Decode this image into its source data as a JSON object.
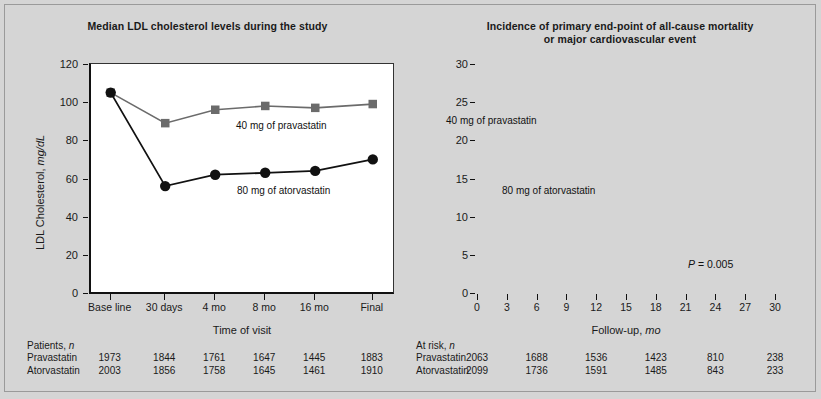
{
  "figure": {
    "background": "#d5d5d5",
    "panel_background": "#ffffff"
  },
  "colors": {
    "pravastatin": "#6b6b6b",
    "atorvastatin": "#111111",
    "axis": "#111111",
    "text": "#1a1a1a"
  },
  "left_panel": {
    "title": "Median LDL cholesterol levels during the study",
    "ylabel_main": "LDL Cholesterol, ",
    "ylabel_unit": "mg/dL",
    "xlabel": "Time of visit",
    "yticks": [
      "0",
      "20",
      "40",
      "60",
      "80",
      "100",
      "120"
    ],
    "xticks": [
      "Base line",
      "30 days",
      "4 mo",
      "8 mo",
      "16 mo",
      "Final"
    ],
    "series_label_pravastatin": "40 mg of pravastatin",
    "series_label_atorvastatin": "80 mg of atorvastatin",
    "risk_table": {
      "header_text": "Patients, ",
      "header_italic": "n",
      "rows": [
        {
          "label": "Pravastatin",
          "values": [
            "1973",
            "1844",
            "1761",
            "1647",
            "1445",
            "1883"
          ]
        },
        {
          "label": "Atorvastatin",
          "values": [
            "2003",
            "1856",
            "1758",
            "1645",
            "1461",
            "1910"
          ]
        }
      ]
    }
  },
  "right_panel": {
    "title_line1": "Incidence of primary end-point of all-cause mortality",
    "title_line2": "or major cardiovascular event",
    "ylabel": "Death or major cardiovascular event, %",
    "xlabel_main": "Follow-up, ",
    "xlabel_unit": "mo",
    "yticks": [
      "0",
      "5",
      "10",
      "15",
      "20",
      "25",
      "30"
    ],
    "xticks": [
      "0",
      "3",
      "6",
      "9",
      "12",
      "15",
      "18",
      "21",
      "24",
      "27",
      "30"
    ],
    "series_label_pravastatin": "40 mg of pravastatin",
    "series_label_atorvastatin": "80 mg of atorvastatin",
    "pvalue_italic": "P",
    "pvalue_text": " = 0.005",
    "risk_table": {
      "header_text": "At risk, ",
      "header_italic": "n",
      "rows": [
        {
          "label": "Pravastatin",
          "values": [
            "2063",
            "1688",
            "1536",
            "1423",
            "810",
            "238"
          ]
        },
        {
          "label": "Atorvastatin",
          "values": [
            "2099",
            "1736",
            "1591",
            "1485",
            "843",
            "233"
          ]
        }
      ]
    }
  },
  "chart_data": [
    {
      "type": "line",
      "id": "ldl-cholesterol",
      "title": "Median LDL cholesterol levels during the study",
      "xlabel": "Time of visit",
      "ylabel": "LDL Cholesterol, mg/dL",
      "categories": [
        "Base line",
        "30 days",
        "4 mo",
        "8 mo",
        "16 mo",
        "Final"
      ],
      "ylim": [
        0,
        120
      ],
      "yticks": [
        0,
        20,
        40,
        60,
        80,
        100,
        120
      ],
      "grid": false,
      "legend": "inline-annotation",
      "series": [
        {
          "name": "40 mg of pravastatin",
          "marker": "square",
          "color": "#6b6b6b",
          "values": [
            105,
            89,
            96,
            98,
            97,
            99
          ]
        },
        {
          "name": "80 mg of atorvastatin",
          "marker": "circle",
          "color": "#111111",
          "values": [
            105,
            56,
            62,
            63,
            64,
            70
          ]
        }
      ],
      "table": {
        "header": "Patients, n",
        "columns": [
          "Base line",
          "30 days",
          "4 mo",
          "8 mo",
          "16 mo",
          "Final"
        ],
        "rows": [
          {
            "label": "Pravastatin",
            "values": [
              1973,
              1844,
              1761,
              1647,
              1445,
              1883
            ]
          },
          {
            "label": "Atorvastatin",
            "values": [
              2003,
              1856,
              1758,
              1645,
              1461,
              1910
            ]
          }
        ]
      }
    },
    {
      "type": "line",
      "id": "primary-endpoint-incidence",
      "title": "Incidence of primary end-point of all-cause mortality or major cardiovascular event",
      "xlabel": "Follow-up, mo",
      "ylabel": "Death or major cardiovascular event, %",
      "xlim": [
        0,
        30
      ],
      "ylim": [
        0,
        30
      ],
      "xticks": [
        0,
        3,
        6,
        9,
        12,
        15,
        18,
        21,
        24,
        27,
        30
      ],
      "yticks": [
        0,
        5,
        10,
        15,
        20,
        25,
        30
      ],
      "grid": false,
      "annotation": "P = 0.005",
      "legend": "inline-annotation",
      "series": [
        {
          "name": "40 mg of pravastatin",
          "color": "#6b6b6b",
          "x": [
            0,
            1,
            2,
            3,
            4,
            5,
            6,
            7,
            8,
            9,
            10,
            11,
            12,
            13,
            14,
            15,
            16,
            17,
            18,
            19,
            20,
            21,
            22,
            23,
            24,
            25,
            26,
            27,
            28
          ],
          "y": [
            1.5,
            3.0,
            4.8,
            6.6,
            8.5,
            10.3,
            12.0,
            13.6,
            15.0,
            16.4,
            17.8,
            18.6,
            19.3,
            20.0,
            20.7,
            21.3,
            21.9,
            22.5,
            23.1,
            23.7,
            24.2,
            24.6,
            25.3,
            25.9,
            26.4,
            26.9,
            27.4,
            28.0,
            28.4
          ]
        },
        {
          "name": "80 mg of atorvastatin",
          "color": "#111111",
          "x": [
            0,
            1,
            2,
            3,
            4,
            5,
            6,
            7,
            8,
            9,
            10,
            11,
            12,
            13,
            14,
            15,
            16,
            17,
            18,
            19,
            20,
            21,
            22,
            23,
            24,
            25,
            26,
            27,
            28
          ],
          "y": [
            1.5,
            3.0,
            4.7,
            6.0,
            7.3,
            8.7,
            10.3,
            11.7,
            13.0,
            14.2,
            15.2,
            16.0,
            16.7,
            17.4,
            18.0,
            18.6,
            19.2,
            19.7,
            20.2,
            20.7,
            21.2,
            21.6,
            21.7,
            21.8,
            22.0,
            22.6,
            23.1,
            23.5,
            24.1
          ]
        }
      ],
      "table": {
        "header": "At risk, n",
        "columns": [
          0,
          6,
          12,
          18,
          24,
          30
        ],
        "rows": [
          {
            "label": "Pravastatin",
            "values": [
              2063,
              1688,
              1536,
              1423,
              810,
              238
            ]
          },
          {
            "label": "Atorvastatin",
            "values": [
              2099,
              1736,
              1591,
              1485,
              843,
              233
            ]
          }
        ]
      }
    }
  ]
}
